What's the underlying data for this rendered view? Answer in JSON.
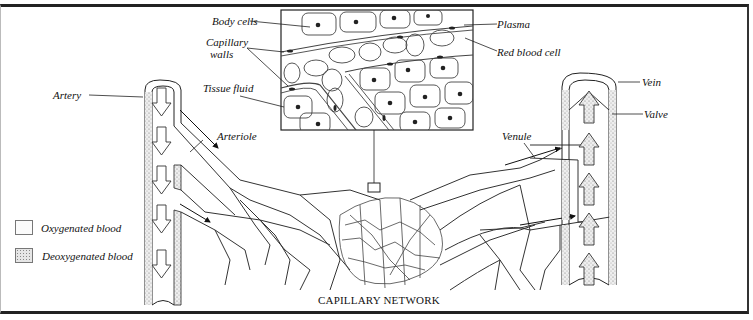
{
  "diagram": {
    "title": "CAPILLARY NETWORK",
    "labels": {
      "body_cells": "Body cells",
      "capillary_walls_1": "Capillary",
      "capillary_walls_2": "walls",
      "tissue_fluid": "Tissue fluid",
      "plasma": "Plasma",
      "red_blood_cell": "Red blood cell",
      "artery": "Artery",
      "arteriole": "Arteriole",
      "venule": "Venule",
      "vein": "Vein",
      "valve": "Valve"
    },
    "legend": [
      {
        "label": "Oxygenated blood",
        "pattern": "plain"
      },
      {
        "label": "Deoxygenated blood",
        "pattern": "stippled"
      }
    ],
    "colors": {
      "line": "#222222",
      "background": "#ffffff",
      "stipple": "#888888"
    }
  }
}
